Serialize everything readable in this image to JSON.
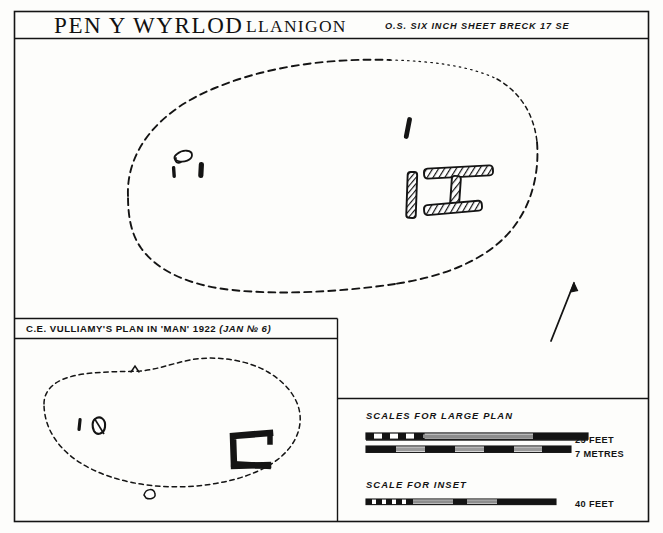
{
  "document": {
    "kind": "archaeological-site-plan",
    "ink_color": "#141414",
    "paper_color": "#fdfdfb"
  },
  "title_block": {
    "site_name": "PEN Y WYRLOD",
    "parish": "LLANIGON",
    "os_reference": "O.S. SIX INCH SHEET BRECK 17 SE"
  },
  "main_plan": {
    "name": "main-plan",
    "cairn_outline_style": "dashed",
    "features": {
      "north_arrow": "north-arrow",
      "chamber_label": "burial-chamber",
      "hatched_stone_count": 3,
      "solid_stone_count": 4,
      "hollow_stone_count": 1
    }
  },
  "inset_plan": {
    "caption_prefix": "C.E. VULLIAMY'S  PLAN  IN  'MAN'  1922 ",
    "caption_italic": "(JAN № 6)",
    "cairn_outline_style": "dashed",
    "chamber_shape": "C-shaped open east"
  },
  "scales": {
    "large_heading": "SCALES FOR LARGE PLAN",
    "inset_heading": "SCALE FOR INSET",
    "bars": [
      {
        "id": "feet-25",
        "label": "25 FEET",
        "length_px": 222,
        "divisions": 5
      },
      {
        "id": "metres-7",
        "label": "7 METRES",
        "length_px": 205,
        "divisions": 7
      },
      {
        "id": "feet-40",
        "label": "40 FEET",
        "length_px": 190,
        "divisions": 4
      }
    ]
  }
}
